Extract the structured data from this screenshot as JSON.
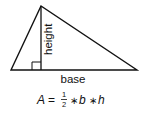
{
  "diagram": {
    "type": "triangle-area",
    "labels": {
      "height": "height",
      "base": "base"
    },
    "formula": {
      "lhs": "A",
      "equals": "=",
      "fraction_num": "1",
      "fraction_den": "2",
      "op1": "∗",
      "b": "b",
      "op2": "∗",
      "h": "h"
    },
    "colors": {
      "stroke": "#111111",
      "background": "#ffffff"
    }
  }
}
